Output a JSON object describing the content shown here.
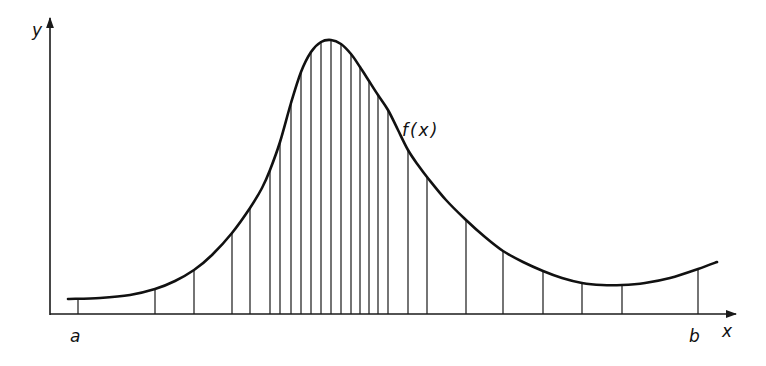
{
  "diagram": {
    "colors": {
      "ink": "#1a1a1a",
      "background": "#ffffff"
    },
    "axes": {
      "x_label": "x",
      "y_label": "y",
      "origin": [
        50,
        314
      ],
      "x_axis_end": 736,
      "y_axis_top": 18
    },
    "curve": {
      "label": "f(x)",
      "label_pos": [
        404,
        132
      ],
      "start": [
        68,
        299
      ],
      "end": [
        717,
        262
      ],
      "points": [
        [
          68,
          299
        ],
        [
          100,
          298
        ],
        [
          130,
          295
        ],
        [
          155,
          289
        ],
        [
          175,
          281
        ],
        [
          194,
          270
        ],
        [
          212,
          255
        ],
        [
          232,
          233
        ],
        [
          250,
          208
        ],
        [
          262,
          188
        ],
        [
          270,
          170
        ],
        [
          280,
          142
        ],
        [
          291,
          103
        ],
        [
          301,
          72
        ],
        [
          311,
          52
        ],
        [
          321,
          42
        ],
        [
          331,
          40
        ],
        [
          341,
          44
        ],
        [
          351,
          54
        ],
        [
          360,
          67
        ],
        [
          369,
          81
        ],
        [
          378,
          95
        ],
        [
          388,
          110
        ],
        [
          398,
          130
        ],
        [
          408,
          150
        ],
        [
          418,
          165
        ],
        [
          427,
          177
        ],
        [
          446,
          200
        ],
        [
          466,
          220
        ],
        [
          485,
          237
        ],
        [
          503,
          251
        ],
        [
          523,
          262
        ],
        [
          543,
          271
        ],
        [
          562,
          278
        ],
        [
          582,
          283
        ],
        [
          602,
          285
        ],
        [
          622,
          285
        ],
        [
          645,
          283
        ],
        [
          670,
          278
        ],
        [
          698,
          269
        ],
        [
          717,
          262
        ]
      ]
    },
    "bounds": {
      "a_label": "a",
      "b_label": "b",
      "a_x": 78,
      "b_x": 698
    },
    "strips": [
      {
        "x": 78,
        "top": 298
      },
      {
        "x": 155,
        "top": 289
      },
      {
        "x": 194,
        "top": 270
      },
      {
        "x": 232,
        "top": 233
      },
      {
        "x": 250,
        "top": 208
      },
      {
        "x": 270,
        "top": 170
      },
      {
        "x": 280,
        "top": 142
      },
      {
        "x": 291,
        "top": 103
      },
      {
        "x": 301,
        "top": 72
      },
      {
        "x": 311,
        "top": 52
      },
      {
        "x": 321,
        "top": 42
      },
      {
        "x": 331,
        "top": 40
      },
      {
        "x": 341,
        "top": 44
      },
      {
        "x": 351,
        "top": 54
      },
      {
        "x": 360,
        "top": 67
      },
      {
        "x": 369,
        "top": 81
      },
      {
        "x": 378,
        "top": 95
      },
      {
        "x": 388,
        "top": 110
      },
      {
        "x": 408,
        "top": 150
      },
      {
        "x": 427,
        "top": 177
      },
      {
        "x": 466,
        "top": 220
      },
      {
        "x": 503,
        "top": 251
      },
      {
        "x": 543,
        "top": 271
      },
      {
        "x": 582,
        "top": 283
      },
      {
        "x": 622,
        "top": 285
      },
      {
        "x": 698,
        "top": 269
      }
    ]
  }
}
